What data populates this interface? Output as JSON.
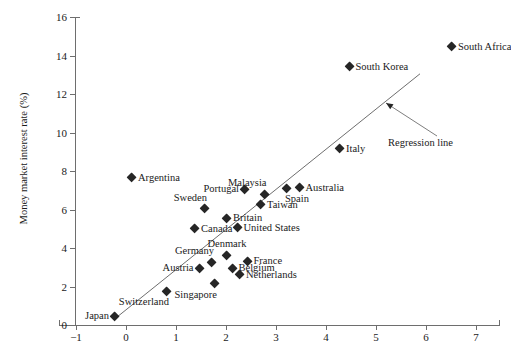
{
  "chart_data": {
    "type": "scatter",
    "title": "",
    "xlabel": "",
    "ylabel": "Money market interest rate (%)",
    "xlim": [
      -1,
      7
    ],
    "ylim": [
      0,
      16
    ],
    "xticks": [
      "−1",
      "0",
      "1",
      "2",
      "3",
      "4",
      "5",
      "6",
      "7"
    ],
    "xtick_values": [
      -1,
      0,
      1,
      2,
      3,
      4,
      5,
      6,
      7
    ],
    "yticks": [
      "0",
      "2",
      "4",
      "6",
      "8",
      "10",
      "12",
      "14",
      "16"
    ],
    "ytick_values": [
      0,
      2,
      4,
      6,
      8,
      10,
      12,
      14,
      16
    ],
    "grid": false,
    "legend": null,
    "marker": "diamond",
    "marker_color": "#262626",
    "line_color": "#6e6e6e",
    "points": [
      {
        "label": "Japan",
        "x": -0.22,
        "y": 0.45,
        "pos": "lbl-left"
      },
      {
        "label": "Switzerland",
        "x": 0.82,
        "y": 1.75,
        "pos": "lbl-below-left"
      },
      {
        "label": "Singapore",
        "x": 1.78,
        "y": 2.15,
        "pos": "lbl-below-left"
      },
      {
        "label": "Austria",
        "x": 1.47,
        "y": 2.95,
        "pos": "lbl-left"
      },
      {
        "label": "Germany",
        "x": 1.72,
        "y": 3.25,
        "pos": "lbl-above-left"
      },
      {
        "label": "Denmark",
        "x": 2.02,
        "y": 3.62,
        "pos": "lbl-above"
      },
      {
        "label": "Belgium",
        "x": 2.13,
        "y": 2.95,
        "pos": "lbl-right"
      },
      {
        "label": "France",
        "x": 2.43,
        "y": 3.3,
        "pos": "lbl-right"
      },
      {
        "label": "Netherlands",
        "x": 2.28,
        "y": 2.62,
        "pos": "lbl-right"
      },
      {
        "label": "Canada",
        "x": 1.38,
        "y": 5.0,
        "pos": "lbl-right"
      },
      {
        "label": "Sweden",
        "x": 1.58,
        "y": 6.05,
        "pos": "lbl-above-left"
      },
      {
        "label": "Britain",
        "x": 2.02,
        "y": 5.55,
        "pos": "lbl-right"
      },
      {
        "label": "United States",
        "x": 2.23,
        "y": 5.05,
        "pos": "lbl-right"
      },
      {
        "label": "Portugal",
        "x": 2.38,
        "y": 7.05,
        "pos": "lbl-left"
      },
      {
        "label": "Malaysia",
        "x": 2.77,
        "y": 6.78,
        "pos": "lbl-above-left"
      },
      {
        "label": "Taiwan",
        "x": 2.7,
        "y": 6.25,
        "pos": "lbl-right"
      },
      {
        "label": "Spain",
        "x": 3.22,
        "y": 7.1,
        "pos": "lbl-below-right"
      },
      {
        "label": "Australia",
        "x": 3.47,
        "y": 7.12,
        "pos": "lbl-right"
      },
      {
        "label": "Italy",
        "x": 4.28,
        "y": 9.15,
        "pos": "lbl-right"
      },
      {
        "label": "South Korea",
        "x": 4.47,
        "y": 13.4,
        "pos": "lbl-right"
      },
      {
        "label": "South Africa",
        "x": 6.52,
        "y": 14.45,
        "pos": "lbl-right"
      },
      {
        "label": "Argentina",
        "x": 0.12,
        "y": 7.65,
        "pos": "lbl-right"
      }
    ],
    "regression_line": {
      "label": "Regression line",
      "x_start": -0.21,
      "y_start": 0.35,
      "x_end": 5.88,
      "y_end": 13.05
    },
    "annotation": {
      "text": "Regression line",
      "arrow_from_x": 437,
      "arrow_from_y": 136,
      "arrow_to_x": 386,
      "arrow_to_y": 103
    }
  }
}
